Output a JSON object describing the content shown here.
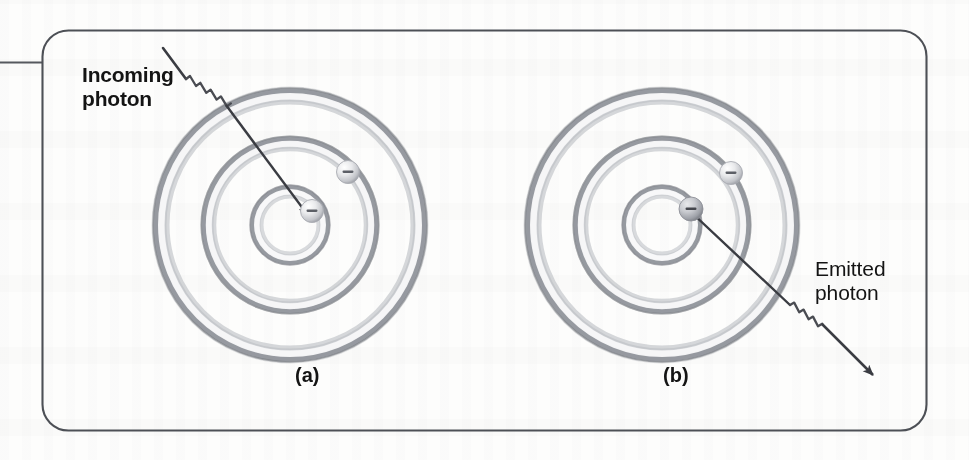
{
  "figure": {
    "kind": "textbook-figure",
    "background_color": "#fdfdfc",
    "border_color": "#4d5056",
    "panels": [
      {
        "id": "a",
        "caption": "(a)",
        "process": "absorption",
        "annotation": {
          "text_line1": "Incoming",
          "text_line2": "photon",
          "full_text": "Incoming photon",
          "bold": true
        },
        "shells": 3,
        "electrons": [
          {
            "shell": 2,
            "position": "outer-right"
          },
          {
            "shell": 1,
            "position": "inner-right"
          }
        ]
      },
      {
        "id": "b",
        "caption": "(b)",
        "process": "emission",
        "annotation": {
          "text_line1": "Emitted",
          "text_line2": "photon",
          "full_text": "Emitted photon",
          "bold": false
        },
        "shells": 3,
        "electrons": [
          {
            "shell": 2,
            "position": "outer-right"
          },
          {
            "shell": 1,
            "position": "inner-right"
          }
        ]
      }
    ],
    "electron_charge_glyph": "−",
    "colors": {
      "shell_dark": "#8d9097",
      "shell_light": "#fbfbfb",
      "arrow": "#3a3c42",
      "text": "#141414",
      "frame": "#4d5056"
    }
  }
}
